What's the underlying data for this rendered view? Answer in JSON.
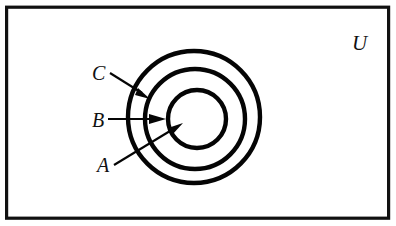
{
  "diagram": {
    "type": "euler-venn-nested-sets",
    "title_visible": false,
    "frame": {
      "label": "U",
      "label_name": "universal-set-label",
      "stroke_color": "#111111"
    },
    "circles": [
      {
        "id": "C",
        "name": "outer-circle-c",
        "cx": 194,
        "cy": 117,
        "r": 66,
        "stroke_color": "#050505"
      },
      {
        "id": "B",
        "name": "middle-circle-b",
        "cx": 195,
        "cy": 119,
        "r": 50,
        "stroke_color": "#050505"
      },
      {
        "id": "A",
        "name": "inner-circle-a",
        "cx": 197,
        "cy": 119,
        "r": 29,
        "stroke_color": "#050505"
      }
    ],
    "labels": [
      {
        "id": "C",
        "text": "C",
        "x": 92,
        "y": 80
      },
      {
        "id": "B",
        "text": "B",
        "x": 92,
        "y": 127
      },
      {
        "id": "A",
        "text": "A",
        "x": 97,
        "y": 172
      }
    ],
    "annotations": {
      "label_c": "C",
      "label_b": "B",
      "label_a": "A",
      "universe": "U"
    }
  }
}
